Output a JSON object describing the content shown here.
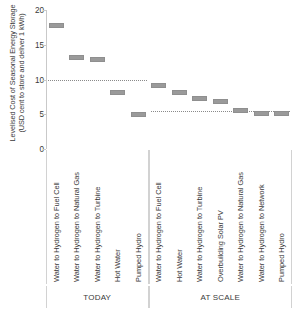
{
  "chart_data": {
    "type": "bar",
    "title": "",
    "xlabel": "",
    "ylabel_lines": [
      "Levelised Cost of Seasonal Energy Storage",
      "(USD cent to store and deliver 1 kWh)"
    ],
    "ylabel": "Levelised Cost of Seasonal Energy Storage (USD cent to store and deliver 1 kWh)",
    "ylim": [
      0,
      20
    ],
    "yticks": [
      20,
      15,
      10,
      5,
      0
    ],
    "ytick_labels": [
      "20",
      "15",
      "10",
      "5",
      "0"
    ],
    "grid": false,
    "legend": "none",
    "marker_color": "#9a9a9a",
    "reference_lines": [
      {
        "value": 9.9,
        "panel": "TODAY",
        "style": "dotted"
      },
      {
        "value": 5.5,
        "panel": "AT SCALE",
        "style": "dotted"
      }
    ],
    "panels": [
      {
        "name": "TODAY",
        "categories": [
          "Water to Hydrogen to Fuel Cell",
          "Water to Hydrogen to Natural Gas",
          "Water to Hydrogen to Turbine",
          "Hot Water",
          "Pumped Hydro"
        ],
        "values": [
          17.8,
          13.2,
          12.9,
          8.2,
          5.0
        ]
      },
      {
        "name": "AT SCALE",
        "categories": [
          "Water to Hydrogen to Fuel Cell",
          "Hot Water",
          "Water to Hydrogen to Turbine",
          "Overbuilding Solar PV",
          "Water to Hydrogen to Natural Gas",
          "Water to Hydrogen to Network",
          "Pumped Hydro"
        ],
        "values": [
          9.2,
          8.2,
          7.3,
          6.8,
          5.5,
          5.1,
          5.1
        ]
      }
    ],
    "categories": [
      "Water to Hydrogen to Fuel Cell",
      "Water to Hydrogen to Natural Gas",
      "Water to Hydrogen to Turbine",
      "Hot Water",
      "Pumped Hydro",
      "Water to Hydrogen to Fuel Cell",
      "Hot Water",
      "Water to Hydrogen to Turbine",
      "Overbuilding Solar PV",
      "Water to Hydrogen to Natural Gas",
      "Water to Hydrogen to Network",
      "Pumped Hydro"
    ],
    "values": [
      17.8,
      13.2,
      12.9,
      8.2,
      5.0,
      9.2,
      8.2,
      7.3,
      6.8,
      5.5,
      5.1,
      5.1
    ]
  }
}
